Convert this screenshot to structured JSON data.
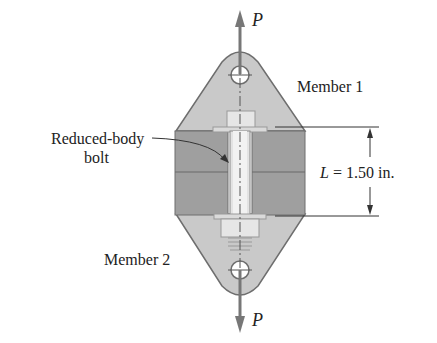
{
  "figure": {
    "load_top_label": "P",
    "load_bottom_label": "P",
    "member1_label": "Member 1",
    "member2_label": "Member 2",
    "bolt_label_line1": "Reduced-body",
    "bolt_label_line2": "bolt",
    "dimension_symbol": "L",
    "dimension_value": " = 1.50 in."
  },
  "colors": {
    "plate_fill": "#c9c9c9",
    "block_fill": "#9d9d9d",
    "arrow": "#777777",
    "outline": "#6e6e6e",
    "text": "#222222"
  }
}
